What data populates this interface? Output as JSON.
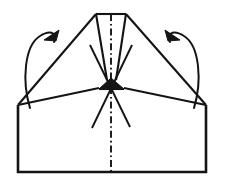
{
  "figure": {
    "background_color": "#ffffff",
    "ink_color": "#141414",
    "width": 228,
    "height": 180,
    "line_style_names": [
      "solid-outline",
      "dash-dot-center-line",
      "curved-rotation-arrow"
    ]
  },
  "shapes": {
    "body_outline": {
      "name": "body-outline",
      "description": "Large rectangular base of the folded paper with angled shoulders",
      "points": "18,105 18,172 206,172 206,105"
    },
    "left_shoulder": {
      "name": "left-shoulder-edge",
      "points": "18,105 96,14"
    },
    "right_shoulder": {
      "name": "right-shoulder-edge",
      "points": "206,105 126,14"
    },
    "top_edge": {
      "name": "top-edge",
      "points": "96,14 126,14"
    },
    "flap_left_edge": {
      "name": "flap-left-edge",
      "points": "96,14 107,80"
    },
    "flap_right_edge": {
      "name": "flap-right-edge",
      "points": "126,14 116,80"
    },
    "horizon_left": {
      "name": "horizontal-crease-left",
      "points": "18,105 99,88"
    },
    "horizon_right": {
      "name": "horizontal-crease-right",
      "points": "206,105 124,88"
    },
    "gusset_triangle": {
      "name": "center-gusset-triangle",
      "points": "111,78 99,89 124,89"
    },
    "gusset_base": {
      "name": "gusset-base-edge",
      "points": "99,89 124,89"
    },
    "diagonal_left": {
      "name": "diagonal-crease-left",
      "description": "crease running from right shoulder area down-left into body",
      "points": "132,45 92,128"
    },
    "diagonal_right": {
      "name": "diagonal-crease-right",
      "description": "crease running from left shoulder area down-right into body",
      "points": "90,45 130,127"
    },
    "center_line": {
      "name": "center-dash-dot-axis",
      "points": "111,14 111,172",
      "dash_pattern": "7,3,1.6,3"
    }
  },
  "arrows": {
    "left": {
      "name": "left-rotation-arrow",
      "direction": "counterclockwise-outward",
      "path": "M 30,108 C 22,82 24,46 40,36 C 53,28 58,36 54,42",
      "head_points": "59,30 44,40 56,41"
    },
    "right": {
      "name": "right-rotation-arrow",
      "direction": "clockwise-outward",
      "path": "M 194,108 C 202,82 200,46 184,36 C 171,28 166,36 170,42",
      "head_points": "165,30 180,40 168,41"
    }
  },
  "labels": {
    "figure_caption": "",
    "step_number": ""
  }
}
